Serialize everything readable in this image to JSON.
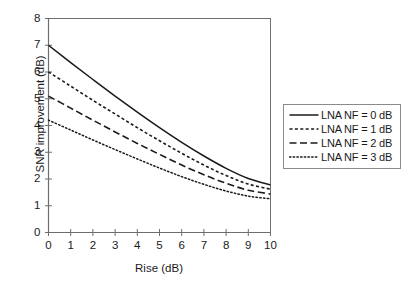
{
  "chart_data": {
    "type": "line",
    "title": "",
    "xlabel": "Rise (dB)",
    "ylabel": "SNR improvement (dB)",
    "xlim": [
      0,
      10
    ],
    "ylim": [
      0,
      8
    ],
    "xticks": [
      "0",
      "1",
      "2",
      "3",
      "4",
      "5",
      "6",
      "7",
      "8",
      "9",
      "10"
    ],
    "yticks": [
      "0",
      "1",
      "2",
      "3",
      "4",
      "5",
      "6",
      "7",
      "8"
    ],
    "grid": false,
    "legend_position": "right",
    "x": [
      0,
      1,
      2,
      3,
      4,
      5,
      6,
      7,
      8,
      9,
      10
    ],
    "series": [
      {
        "name": "LNA NF = 0 dB",
        "style": "solid",
        "color": "#1a1a1a",
        "values": [
          7.0,
          6.35,
          5.72,
          5.1,
          4.5,
          3.92,
          3.37,
          2.86,
          2.4,
          2.02,
          1.78
        ]
      },
      {
        "name": "LNA NF = 1 dB",
        "style": "dashed-short",
        "color": "#1a1a1a",
        "values": [
          6.0,
          5.47,
          4.94,
          4.43,
          3.92,
          3.43,
          2.96,
          2.52,
          2.13,
          1.81,
          1.62
        ]
      },
      {
        "name": "LNA NF = 2 dB",
        "style": "dashed-long",
        "color": "#1a1a1a",
        "values": [
          5.1,
          4.65,
          4.2,
          3.76,
          3.33,
          2.92,
          2.52,
          2.16,
          1.84,
          1.58,
          1.44
        ]
      },
      {
        "name": "LNA NF = 3 dB",
        "style": "dotted",
        "color": "#1a1a1a",
        "values": [
          4.2,
          3.83,
          3.46,
          3.1,
          2.75,
          2.41,
          2.09,
          1.8,
          1.55,
          1.36,
          1.26
        ]
      }
    ]
  },
  "legend": {
    "items": [
      {
        "label": "LNA NF = 0 dB"
      },
      {
        "label": "LNA NF = 1 dB"
      },
      {
        "label": "LNA NF = 2 dB"
      },
      {
        "label": "LNA NF = 3 dB"
      }
    ]
  },
  "axes": {
    "x_title": "Rise (dB)",
    "y_title": "SNR improvement (dB)"
  }
}
